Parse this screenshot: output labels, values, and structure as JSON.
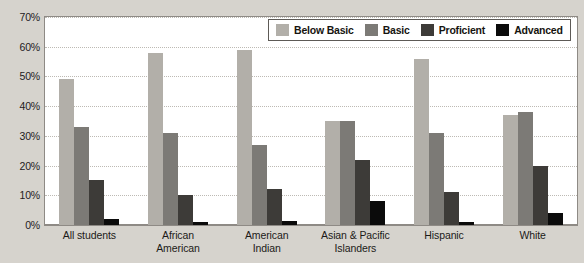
{
  "chart_data": {
    "type": "bar",
    "title": "",
    "xlabel": "",
    "ylabel": "",
    "ylim": [
      0,
      70
    ],
    "ytick_labels": [
      "70%",
      "60%",
      "50%",
      "40%",
      "30%",
      "20%",
      "10%",
      "0%"
    ],
    "ytick_values": [
      70,
      60,
      50,
      40,
      30,
      20,
      10,
      0
    ],
    "grid": true,
    "legend_position": "top-right",
    "categories": [
      "All students",
      "African American",
      "American Indian",
      "Asian & Pacific Islanders",
      "Hispanic",
      "White"
    ],
    "category_lines": [
      [
        "All students"
      ],
      [
        "African",
        "American"
      ],
      [
        "American",
        "Indian"
      ],
      [
        "Asian & Pacific",
        "Islanders"
      ],
      [
        "Hispanic"
      ],
      [
        "White"
      ]
    ],
    "series": [
      {
        "name": "Below Basic",
        "color": "#b2afa9",
        "values": [
          49,
          58,
          59,
          35,
          56,
          37
        ]
      },
      {
        "name": "Basic",
        "color": "#7c7a76",
        "values": [
          33,
          31,
          27,
          35,
          31,
          38
        ]
      },
      {
        "name": "Proficient",
        "color": "#3d3b38",
        "values": [
          15,
          10,
          12,
          22,
          11,
          20
        ]
      },
      {
        "name": "Advanced",
        "color": "#0b0b0b",
        "values": [
          2,
          1,
          1.5,
          8,
          1,
          4
        ]
      }
    ]
  },
  "colors": {
    "page_background": "#d6d3cd",
    "plot_background": "#ffffff",
    "axis": "#8e8a85",
    "gridline": "#bdbab4",
    "text": "#1c1a18"
  }
}
